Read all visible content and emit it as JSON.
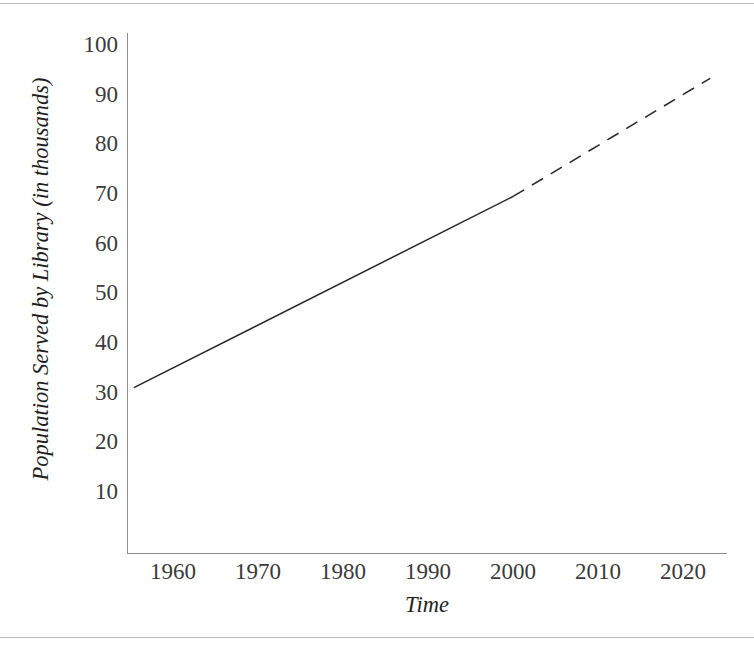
{
  "page": {
    "cutoff_text_above": "",
    "rules": {
      "top_y": 3,
      "bottom_y": 637,
      "color": "#b9b9b9"
    }
  },
  "chart_data": {
    "type": "line",
    "title": "",
    "xlabel": "Time",
    "ylabel": "Population Served by Library (in thousands)",
    "xlim": [
      1955.2,
      2023.5
    ],
    "ylim": [
      0,
      102
    ],
    "xticks": [
      1960,
      1970,
      1980,
      1990,
      2000,
      2010,
      2020
    ],
    "xticklabels": [
      "1960",
      "1970",
      "1980",
      "1990",
      "2000",
      "2010",
      "2020"
    ],
    "yticks": [
      10,
      20,
      30,
      40,
      50,
      60,
      70,
      80,
      90,
      100
    ],
    "yticklabels": [
      "10",
      "20",
      "30",
      "40",
      "50",
      "60",
      "70",
      "80",
      "90",
      "100"
    ],
    "grid": false,
    "legend": false,
    "legend_position": "none",
    "axis_color": "#8e8e8e",
    "line_color": "#262626",
    "series": [
      {
        "name": "Actual population served (observed)",
        "style": "solid",
        "x": [
          1955.4,
          2000
        ],
        "y": [
          31.0,
          69.5
        ]
      },
      {
        "name": "Projected population served (extrapolated)",
        "style": "dashed",
        "x": [
          2000,
          2023.2
        ],
        "y": [
          69.5,
          93.3
        ]
      }
    ],
    "annotations": []
  }
}
